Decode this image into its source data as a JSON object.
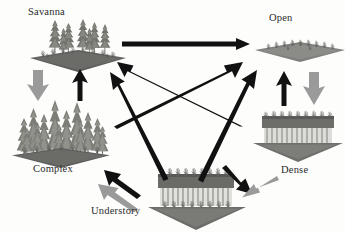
{
  "diagram": {
    "background_color": "#fdfdfc",
    "arrow_black": "#111111",
    "arrow_gray": "#9a9a9a",
    "label_color": "#2b2b2b",
    "canopy_dark": "#6e6e6e",
    "canopy_mid": "#8d8d8d",
    "ground_dark": "#5d5d5d",
    "trunk_light": "#d8d8d4"
  },
  "states": [
    {
      "id": "savanna",
      "label": "Savanna",
      "label_x": 28,
      "label_y": 8,
      "panel_x": 28,
      "panel_y": 20,
      "panel_w": 96,
      "panel_h": 50,
      "structure": "sparse-tall-trees-on-grass"
    },
    {
      "id": "open",
      "label": "Open",
      "label_x": 268,
      "label_y": 14,
      "panel_x": 255,
      "panel_y": 38,
      "panel_w": 90,
      "panel_h": 30,
      "structure": "flat-low-vegetation"
    },
    {
      "id": "complex",
      "label": "Complex",
      "label_x": 33,
      "label_y": 165,
      "panel_x": 12,
      "panel_y": 96,
      "panel_w": 98,
      "panel_h": 66,
      "structure": "multi-layered-dense-forest"
    },
    {
      "id": "dense",
      "label": "Dense",
      "label_x": 280,
      "label_y": 165,
      "panel_x": 253,
      "panel_y": 112,
      "panel_w": 90,
      "panel_h": 50,
      "structure": "uniform-closed-canopy-with-trunks"
    },
    {
      "id": "understory",
      "label": "Understory",
      "label_x": 92,
      "label_y": 206,
      "panel_x": 148,
      "panel_y": 168,
      "panel_w": 98,
      "panel_h": 62,
      "structure": "closed-canopy-with-understory"
    }
  ],
  "arrows": [
    {
      "id": "savanna-to-open",
      "from": "savanna",
      "to": "open",
      "style": "black",
      "kind": "straight-horizontal",
      "x1": 122,
      "y1": 44,
      "x2": 250,
      "y2": 44
    },
    {
      "id": "savanna-to-complex",
      "from": "savanna",
      "to": "complex",
      "style": "gray",
      "kind": "thick-down",
      "x1": 38,
      "y1": 70,
      "x2": 38,
      "y2": 100
    },
    {
      "id": "complex-to-savanna",
      "from": "complex",
      "to": "savanna",
      "style": "black",
      "kind": "thin-up",
      "x1": 80,
      "y1": 100,
      "x2": 80,
      "y2": 70
    },
    {
      "id": "open-to-dense",
      "from": "open",
      "to": "dense",
      "style": "gray",
      "kind": "thick-down",
      "x1": 314,
      "y1": 72,
      "x2": 314,
      "y2": 105
    },
    {
      "id": "dense-to-open",
      "from": "dense",
      "to": "open",
      "style": "black",
      "kind": "thin-up",
      "x1": 284,
      "y1": 105,
      "x2": 284,
      "y2": 72
    },
    {
      "id": "dense-to-savanna",
      "from": "dense",
      "to": "savanna",
      "style": "black",
      "kind": "diagonal",
      "x1": 243,
      "y1": 124,
      "x2": 117,
      "y2": 62
    },
    {
      "id": "complex-to-open",
      "from": "complex",
      "to": "open",
      "style": "black",
      "kind": "diagonal",
      "x1": 114,
      "y1": 124,
      "x2": 243,
      "y2": 62
    },
    {
      "id": "understory-to-savanna",
      "from": "understory",
      "to": "savanna",
      "style": "black",
      "kind": "diagonal",
      "x1": 166,
      "y1": 178,
      "x2": 110,
      "y2": 72
    },
    {
      "id": "understory-to-open",
      "from": "understory",
      "to": "open",
      "style": "black",
      "kind": "diagonal",
      "x1": 200,
      "y1": 178,
      "x2": 255,
      "y2": 70
    },
    {
      "id": "understory-to-complex-black",
      "from": "understory",
      "to": "complex",
      "style": "black",
      "kind": "diagonal",
      "x1": 140,
      "y1": 194,
      "x2": 104,
      "y2": 170
    },
    {
      "id": "understory-to-complex-gray",
      "from": "understory",
      "to": "complex",
      "style": "gray",
      "kind": "diagonal",
      "x1": 137,
      "y1": 208,
      "x2": 98,
      "y2": 184
    },
    {
      "id": "understory-to-dense-black",
      "from": "understory",
      "to": "dense",
      "style": "black",
      "kind": "diagonal",
      "x1": 228,
      "y1": 166,
      "x2": 252,
      "y2": 192
    },
    {
      "id": "understory-to-dense-gray",
      "from": "understory",
      "to": "dense",
      "style": "gray",
      "kind": "diagonal",
      "x1": 275,
      "y1": 177,
      "x2": 242,
      "y2": 197
    }
  ]
}
